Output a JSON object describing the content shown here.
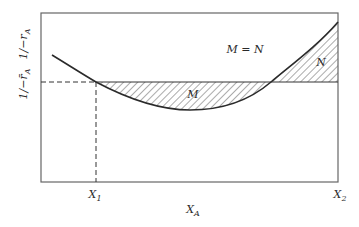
{
  "diagram": {
    "type": "levenspiel-area-diagram",
    "y_axis_labels": {
      "upper": {
        "main": "1/−r",
        "sub": "A"
      },
      "lower": {
        "main": "1/−r̄",
        "sub": "A"
      }
    },
    "x_axis": {
      "label_main": "X",
      "label_sub": "A",
      "tick_start": {
        "main": "X",
        "sub": "1"
      },
      "tick_end": {
        "main": "X",
        "sub": "2"
      }
    },
    "annotations": {
      "equality": "M = N",
      "region_below": "M",
      "region_above": "N"
    },
    "colors": {
      "line": "#2a2a2a",
      "frame": "#666666",
      "hatch": "#444444",
      "background": "#ffffff"
    }
  }
}
